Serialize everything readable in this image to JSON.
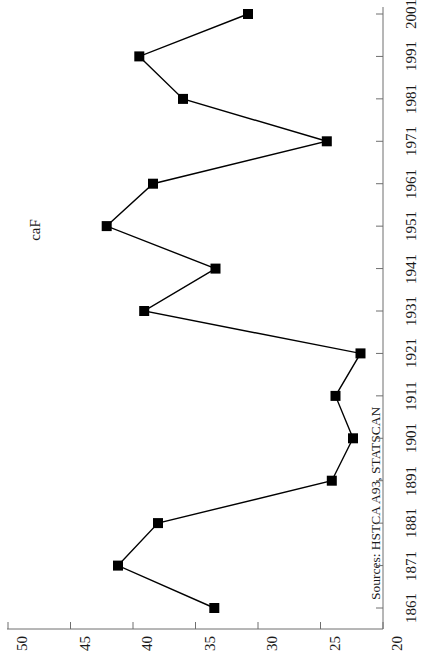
{
  "chart_data": {
    "type": "line",
    "title": "",
    "xlabel": "",
    "ylabel": "caF",
    "orientation": "rotated-90",
    "grid": false,
    "legend": null,
    "marker": "filled-square",
    "line_color": "#000000",
    "marker_color": "#000000",
    "categories": [
      1861,
      1871,
      1881,
      1891,
      1901,
      1911,
      1921,
      1931,
      1941,
      1951,
      1961,
      1971,
      1981,
      1991,
      2001
    ],
    "x": [
      1861,
      1871,
      1881,
      1891,
      1901,
      1911,
      1921,
      1931,
      1941,
      1951,
      1961,
      1971,
      1981,
      1991,
      2001
    ],
    "values": [
      33.5,
      41.2,
      38.0,
      24.1,
      22.4,
      23.8,
      21.8,
      39.1,
      33.4,
      42.1,
      38.4,
      24.5,
      36.0,
      39.5,
      30.8
    ],
    "xlim": [
      1856,
      2006
    ],
    "ylim": [
      20,
      50
    ],
    "ytick_labels": [
      "50",
      "45",
      "40",
      "35",
      "30",
      "25",
      "20"
    ],
    "ytick_values": [
      50,
      45,
      40,
      35,
      30,
      25,
      20
    ],
    "xtick_labels": [
      "1861",
      "1871",
      "1881",
      "1891",
      "1901",
      "1911",
      "1921",
      "1931",
      "1941",
      "1951",
      "1961",
      "1971",
      "1981",
      "1991",
      "2001"
    ],
    "source_note": "Sources: HSTCA A93, STATSCAN"
  },
  "axis": {
    "value_axis_title": "caF",
    "value_ticks": [
      "50",
      "45",
      "40",
      "35",
      "30",
      "25",
      "20"
    ],
    "year_ticks": [
      "1861",
      "1871",
      "1881",
      "1891",
      "1901",
      "1911",
      "1921",
      "1931",
      "1941",
      "1951",
      "1961",
      "1971",
      "1981",
      "1991",
      "2001"
    ]
  },
  "footer": {
    "source_note": "Sources: HSTCA A93, STATSCAN"
  }
}
